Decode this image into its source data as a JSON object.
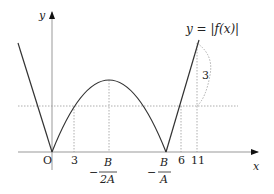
{
  "diagram": {
    "curve_label": "y = |f(x)|",
    "axes": {
      "x_label": "x",
      "y_label": "y",
      "origin_label": "O"
    },
    "x_ticks": {
      "t3": "3",
      "vertex_num": "B",
      "vertex_den": "2A",
      "vertex_sign": "−",
      "root_num": "B",
      "root_den": "A",
      "root_sign": "−",
      "t6": "6",
      "t11": "11"
    },
    "gap_label": "3",
    "colors": {
      "curve": "#333333",
      "axis": "#999999",
      "dotted": "#999999",
      "text": "#222222"
    }
  }
}
